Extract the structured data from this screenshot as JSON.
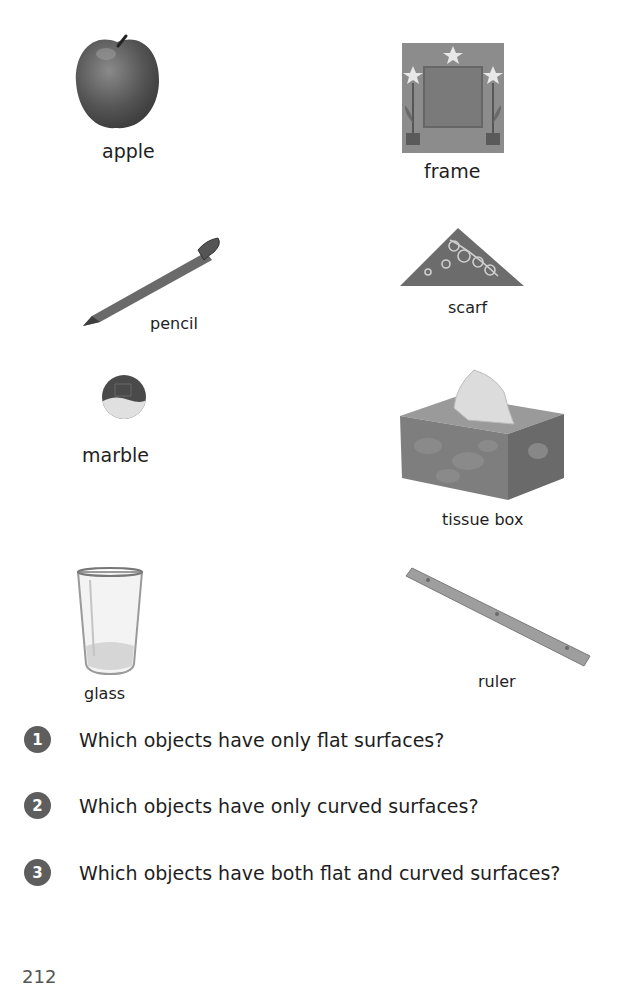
{
  "objects": [
    {
      "id": "apple",
      "label": "apple"
    },
    {
      "id": "frame",
      "label": "frame"
    },
    {
      "id": "pencil",
      "label": "pencil"
    },
    {
      "id": "scarf",
      "label": "scarf"
    },
    {
      "id": "marble",
      "label": "marble"
    },
    {
      "id": "tissue_box",
      "label": "tissue box"
    },
    {
      "id": "glass",
      "label": "glass"
    },
    {
      "id": "ruler",
      "label": "ruler"
    }
  ],
  "questions": [
    {
      "number": "1",
      "text": "Which objects have only flat surfaces?"
    },
    {
      "number": "2",
      "text": "Which objects have only curved surfaces?"
    },
    {
      "number": "3",
      "text": "Which objects have both flat and curved surfaces?"
    }
  ],
  "page_number": "212",
  "colors": {
    "number_circle": "#5e5e5e",
    "text": "#1e1e1e"
  }
}
